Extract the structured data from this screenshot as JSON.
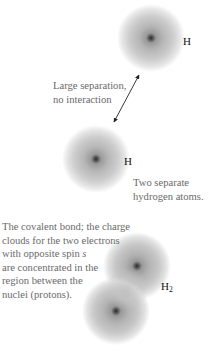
{
  "figure": {
    "top_atom": {
      "label": "H"
    },
    "separation_caption": {
      "lines": [
        "Large separation,",
        "no interaction"
      ]
    },
    "middle_atom": {
      "label": "H"
    },
    "separate_atoms_caption": {
      "lines": [
        "Two separate",
        "hydrogen atoms."
      ]
    },
    "bond_caption": {
      "lines": [
        "The covalent bond; the charge",
        "clouds for the two electrons",
        "with opposite spin ",
        "are concentrated in the",
        "region between the",
        "nuclei (protons)."
      ],
      "spin_symbol": "s"
    },
    "molecule": {
      "label": "H",
      "subscript": "2"
    },
    "colors": {
      "cloud": "#8a8a8a",
      "nucleus": "#2a2a2a",
      "caption_text": "#6a6a6a",
      "label_text": "#111111",
      "arrow": "#222222"
    }
  }
}
